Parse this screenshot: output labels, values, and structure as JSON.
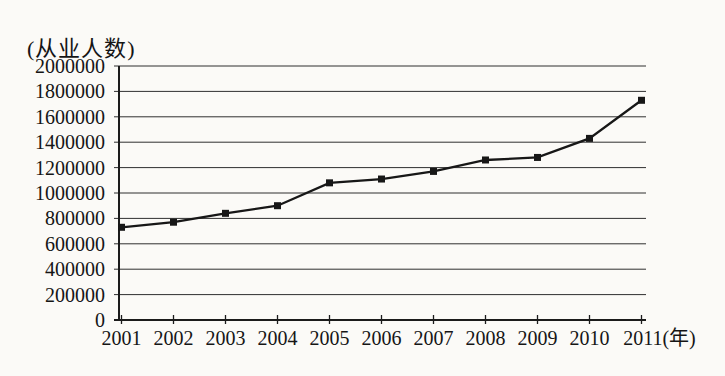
{
  "page": {
    "background_color": "#fbfaf7",
    "ink_color": "#1b1b1b"
  },
  "chart_data": {
    "type": "line",
    "title": "(从业人数)",
    "ylabel": "从业人数",
    "xlabel": "年",
    "x_axis_unit_suffix": "(年)",
    "categories": [
      "2001",
      "2002",
      "2003",
      "2004",
      "2005",
      "2006",
      "2007",
      "2008",
      "2009",
      "2010",
      "2011"
    ],
    "series": [
      {
        "name": "从业人数",
        "values": [
          730000,
          770000,
          840000,
          900000,
          1080000,
          1110000,
          1170000,
          1260000,
          1280000,
          1430000,
          1730000
        ]
      }
    ],
    "ylim": [
      0,
      2000000
    ],
    "ytick_step": 200000,
    "yticks": [
      2000000,
      1800000,
      1600000,
      1400000,
      1200000,
      1000000,
      800000,
      600000,
      400000,
      200000,
      0
    ],
    "grid": "horizontal",
    "legend": false,
    "marker": "square",
    "line_color": "#171717",
    "axis_color": "#1b1b1b",
    "grid_color": "#2f2f2f"
  }
}
